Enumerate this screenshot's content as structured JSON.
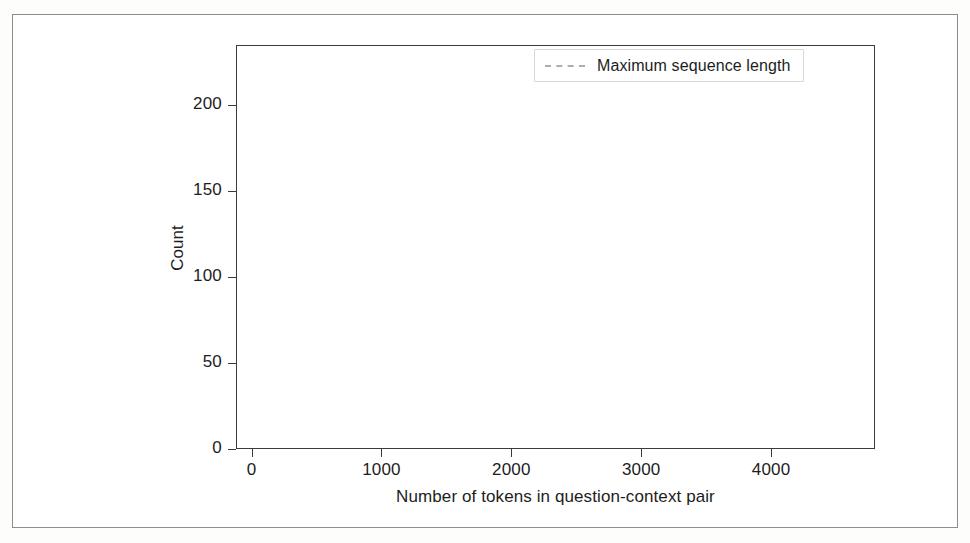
{
  "figure": {
    "bar_color": "#8b8b8b",
    "line_color": "#aeaeae",
    "axis_color": "#3b3b3b",
    "frame_color": "#8d8d8d"
  },
  "legend": {
    "position": "upper right",
    "entries": [
      {
        "label": "Maximum sequence length",
        "style": "dashed",
        "color": "#aeaeae"
      }
    ],
    "label": "Maximum sequence length"
  },
  "chart_data": {
    "type": "bar",
    "title": "",
    "subtitle": "",
    "xlabel": "Number of tokens in question-context pair",
    "ylabel": "Count",
    "xlim": [
      -120,
      4800
    ],
    "ylim": [
      0,
      235
    ],
    "xticks": [
      0,
      1000,
      2000,
      3000,
      4000
    ],
    "xtick_labels": [
      "0",
      "1000",
      "2000",
      "3000",
      "4000"
    ],
    "yticks": [
      0,
      50,
      100,
      150,
      200
    ],
    "ytick_labels": [
      "0",
      "50",
      "100",
      "150",
      "200"
    ],
    "grid": false,
    "bin_width": 50,
    "bin_starts": [
      0,
      50,
      100,
      150,
      200,
      250,
      300,
      350,
      400,
      450,
      500,
      550,
      600,
      650,
      700,
      750,
      800,
      850,
      900,
      950,
      1000,
      1050,
      1100,
      1150,
      1200,
      1250,
      1300,
      1350,
      1400,
      1450,
      1500,
      1550,
      1600,
      1650,
      1700,
      1750,
      1800,
      1850,
      1900,
      1950,
      2000,
      2050,
      2100,
      2150,
      2200,
      2250,
      2300,
      2350,
      2400,
      2450,
      2500,
      2550,
      2600,
      2650,
      2700,
      2750,
      2800,
      2850,
      2900,
      2950,
      3000,
      3050,
      3100,
      3150,
      3200,
      3250,
      3300,
      3350,
      3400,
      3450,
      3500,
      3550,
      3600,
      3650,
      3700,
      3750,
      3800,
      3850,
      3900,
      3950,
      4000,
      4050,
      4100,
      4150,
      4200,
      4250,
      4300,
      4350,
      4400,
      4450,
      4500,
      4550,
      4600,
      4650
    ],
    "values": [
      223,
      202,
      178,
      178,
      123,
      122,
      121,
      96,
      72,
      70,
      52,
      48,
      46,
      32,
      30,
      29,
      18,
      16,
      22,
      12,
      26,
      25,
      14,
      10,
      9,
      12,
      4,
      3,
      8,
      3,
      1,
      0,
      1,
      2,
      0,
      1,
      1,
      2,
      1,
      0,
      3,
      1,
      0,
      1,
      0,
      1,
      1,
      0,
      1,
      0,
      2,
      1,
      1,
      0,
      2,
      1,
      2,
      1,
      2,
      1,
      1,
      0,
      0,
      0,
      0,
      0,
      0,
      0,
      0,
      0,
      0,
      0,
      0,
      0,
      0,
      0,
      0,
      0,
      0,
      0,
      2,
      0,
      0,
      0,
      0,
      0,
      0,
      0,
      0,
      0,
      0,
      0,
      0,
      2
    ],
    "annotations": [
      {
        "name": "max-sequence-length",
        "type": "vline",
        "x": 512,
        "label": "Maximum sequence length",
        "style": "dashed"
      }
    ],
    "series": [
      {
        "name": "Token count distribution",
        "color": "#8b8b8b"
      }
    ]
  }
}
